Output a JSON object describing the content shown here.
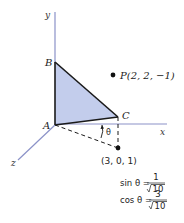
{
  "axes": {
    "x": "x",
    "y": "y",
    "z": "z"
  },
  "points": {
    "A": "A",
    "B": "B",
    "C": "C",
    "P": "P(2, 2, −1)",
    "projection": "(3, 0, 1)"
  },
  "angle": "θ",
  "formulas": {
    "sin_lhs": "sin θ =",
    "sin_num": "1",
    "sin_den": "10",
    "cos_lhs": "cos θ =",
    "cos_num": "3",
    "cos_den": "10"
  },
  "colors": {
    "triangle_fill": "#c3cdec",
    "axis": "#8b92c8",
    "edge": "#1a1a1a"
  }
}
